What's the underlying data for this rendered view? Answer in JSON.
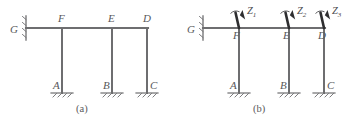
{
  "figure": {
    "caption_a": "(a)",
    "caption_b": "(b)",
    "line_color": "#6e6e70",
    "label_color": "#58585a"
  },
  "diagram_a": {
    "caption": "(a)",
    "support_left_label": "G",
    "beam_nodes": [
      {
        "id": "F",
        "label": "F"
      },
      {
        "id": "E",
        "label": "E"
      },
      {
        "id": "D",
        "label": "D"
      }
    ],
    "base_supports": [
      {
        "id": "A",
        "label": "A"
      },
      {
        "id": "B",
        "label": "B"
      },
      {
        "id": "C",
        "label": "C"
      }
    ]
  },
  "diagram_b": {
    "caption": "(b)",
    "support_left_label": "G",
    "beam_nodes": [
      {
        "id": "F",
        "label": "F"
      },
      {
        "id": "E",
        "label": "E"
      },
      {
        "id": "D",
        "label": "D"
      }
    ],
    "base_supports": [
      {
        "id": "A",
        "label": "A"
      },
      {
        "id": "B",
        "label": "B"
      },
      {
        "id": "C",
        "label": "C"
      }
    ],
    "unknowns": [
      {
        "id": "Z1",
        "symbol": "Z",
        "subscript": "1"
      },
      {
        "id": "Z2",
        "symbol": "Z",
        "subscript": "2"
      },
      {
        "id": "Z3",
        "symbol": "Z",
        "subscript": "3"
      }
    ]
  }
}
